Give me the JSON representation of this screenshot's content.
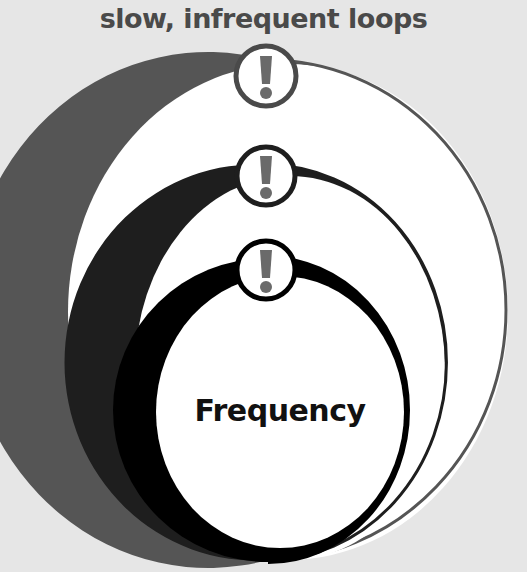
{
  "title": "slow, infrequent loops",
  "center_label": "Frequency",
  "loops": [
    {
      "name": "outer",
      "color": "#555555",
      "icon": "exclamation-icon"
    },
    {
      "name": "middle",
      "color": "#1e1e1e",
      "icon": "exclamation-icon"
    },
    {
      "name": "inner",
      "color": "#000000",
      "icon": "exclamation-icon"
    }
  ],
  "colors": {
    "background": "#e6e6e6",
    "fill": "#ffffff",
    "icon_glyph": "#6a6a6a"
  }
}
